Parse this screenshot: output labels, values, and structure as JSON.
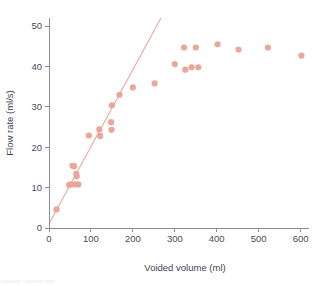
{
  "chart_data": {
    "type": "scatter",
    "title": "",
    "xlabel": "Voided volume (ml)",
    "ylabel": "Flow rate (ml/s)",
    "xlim": [
      0,
      620
    ],
    "ylim": [
      0,
      52
    ],
    "xticks": [
      0,
      100,
      200,
      300,
      400,
      500,
      600
    ],
    "yticks": [
      0,
      10,
      20,
      30,
      40,
      50
    ],
    "grid": false,
    "legend": "none",
    "marker_color": "#e9a79b",
    "line_color": "#e8a89c",
    "axis_color": "#8c8e9a",
    "text_color": "#3e4354",
    "series": [
      {
        "name": "Measurements",
        "marker": "circle",
        "points": [
          [
            18,
            4.6
          ],
          [
            48,
            10.7
          ],
          [
            52,
            10.8
          ],
          [
            56,
            15.4
          ],
          [
            60,
            15.3
          ],
          [
            62,
            10.8
          ],
          [
            65,
            13.4
          ],
          [
            66,
            12.8
          ],
          [
            70,
            10.8
          ],
          [
            95,
            22.9
          ],
          [
            120,
            24.4
          ],
          [
            122,
            22.8
          ],
          [
            148,
            26.2
          ],
          [
            149,
            24.3
          ],
          [
            150,
            30.4
          ],
          [
            168,
            33.0
          ],
          [
            200,
            34.8
          ],
          [
            252,
            35.8
          ],
          [
            300,
            40.6
          ],
          [
            322,
            44.7
          ],
          [
            325,
            39.2
          ],
          [
            340,
            39.8
          ],
          [
            350,
            44.7
          ],
          [
            356,
            39.8
          ],
          [
            402,
            45.5
          ],
          [
            452,
            44.2
          ],
          [
            522,
            44.7
          ],
          [
            602,
            42.7
          ]
        ]
      }
    ],
    "fit_line": {
      "name": "Regression line",
      "x_start": 2,
      "y_start": 1.4,
      "x_end": 267,
      "y_end": 52.0
    }
  },
  "caption": {
    "text": "clipped caption text"
  }
}
